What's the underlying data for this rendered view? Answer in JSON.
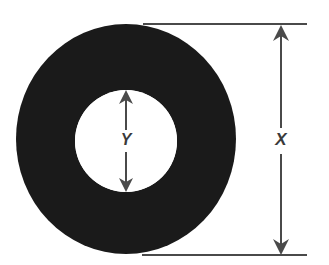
{
  "diagram": {
    "type": "engineering-dimension-diagram",
    "background_color": "#ffffff",
    "shape": {
      "name": "annulus",
      "fill_color": "#1a1a1a",
      "hole_fill_color": "#ffffff",
      "outer": {
        "center_x": 126,
        "center_y": 139,
        "radius_x": 110,
        "radius_y": 115
      },
      "inner": {
        "center_x": 126,
        "center_y": 141,
        "radius_x": 51,
        "radius_y": 51
      }
    },
    "line_color": "#4a4a4a",
    "dimensions": [
      {
        "id": "outer-diameter",
        "label": "X",
        "measures": "outer diameter",
        "orientation": "vertical",
        "line_x": 281,
        "top_y": 25,
        "bottom_y": 255,
        "label_x": 281,
        "label_y": 141,
        "arrowheads": "both",
        "extension_lines": [
          {
            "id": "top",
            "y": 24,
            "x_start": 143,
            "x_end": 307
          },
          {
            "id": "bottom",
            "y": 255,
            "x_start": 142,
            "x_end": 307
          }
        ]
      },
      {
        "id": "inner-diameter",
        "label": "Y",
        "measures": "inner hole diameter",
        "orientation": "vertical",
        "line_x": 126,
        "top_y": 91,
        "bottom_y": 191,
        "label_x": 126,
        "label_y": 141,
        "arrowheads": "both",
        "extension_lines": []
      }
    ]
  }
}
